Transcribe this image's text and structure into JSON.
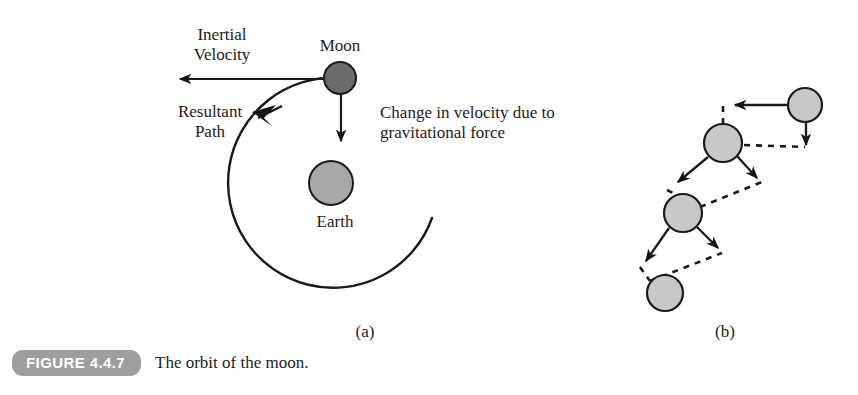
{
  "figure": {
    "badge": "FIGURE 4.4.7",
    "caption": "The orbit of the moon.",
    "panel_a_label": "(a)",
    "panel_b_label": "(b)"
  },
  "panel_a": {
    "labels": {
      "inertial_velocity": "Inertial\nVelocity",
      "resultant_path": "Resultant\nPath",
      "moon": "Moon",
      "change_in_velocity": "Change in velocity due to\ngravitational force",
      "earth": "Earth"
    },
    "geometry": {
      "orbit_center_x": 333,
      "orbit_center_y": 185,
      "orbit_radius": 105,
      "moon_x": 340,
      "moon_y": 78,
      "moon_r": 16,
      "earth_x": 331,
      "earth_y": 183,
      "earth_r": 22,
      "inertial_arrow_tip_x": 172,
      "inertial_arrow_tail_x": 340,
      "inertial_arrow_y": 79,
      "gravity_arrow_x": 341,
      "gravity_arrow_tail_y": 94,
      "gravity_arrow_tip_y": 147
    }
  },
  "panel_b": {
    "circles": [
      {
        "cx": 805,
        "cy": 105,
        "r": 17
      },
      {
        "cx": 723,
        "cy": 143,
        "r": 19
      },
      {
        "cx": 683,
        "cy": 213,
        "r": 19
      },
      {
        "cx": 665,
        "cy": 293,
        "r": 18
      }
    ],
    "solid_arrows": [
      {
        "x1": 788,
        "y1": 105,
        "x2": 730,
        "y2": 105
      },
      {
        "x1": 806,
        "y1": 122,
        "x2": 806,
        "y2": 150
      },
      {
        "x1": 707,
        "y1": 157,
        "x2": 672,
        "y2": 186
      },
      {
        "x1": 738,
        "y1": 157,
        "x2": 762,
        "y2": 183
      },
      {
        "x1": 668,
        "y1": 227,
        "x2": 640,
        "y2": 265
      },
      {
        "x1": 698,
        "y1": 227,
        "x2": 723,
        "y2": 252
      }
    ],
    "dashed_paths": [
      {
        "x1": 723,
        "y1": 124,
        "x2": 723,
        "y2": 103
      },
      {
        "x1": 743,
        "y1": 145,
        "x2": 806,
        "y2": 150
      },
      {
        "x1": 668,
        "y1": 189,
        "x2": 700,
        "y2": 206
      },
      {
        "x1": 702,
        "y1": 205,
        "x2": 762,
        "y2": 183
      },
      {
        "x1": 639,
        "y1": 268,
        "x2": 651,
        "y2": 280
      },
      {
        "x1": 651,
        "y1": 280,
        "x2": 723,
        "y2": 252
      }
    ]
  },
  "colors": {
    "moon_fill": "#6b6b6b",
    "earth_fill": "#a8a8a8",
    "panel_b_circle_fill": "#c8c8c8",
    "stroke": "#1a1a1a",
    "badge_bg": "#9e9e9e",
    "badge_text": "#ffffff",
    "page_bg": "#ffffff"
  }
}
